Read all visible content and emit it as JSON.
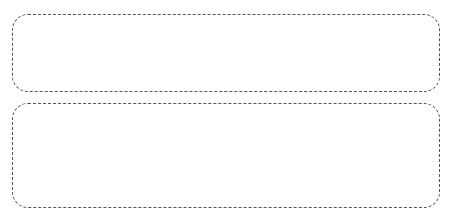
{
  "diagrams": [
    {
      "name": "flat-tree",
      "root": "X",
      "children": [
        "1",
        "2",
        "3",
        "4",
        "5",
        "6",
        "7",
        "8",
        "9",
        "10",
        "11",
        "12",
        "13",
        "14",
        "15",
        "16",
        "17",
        "18"
      ]
    },
    {
      "name": "hierarchical-tree",
      "root": "X",
      "groups": [
        {
          "label": "1",
          "children": [
            "4",
            "5",
            "6",
            "7",
            "8"
          ]
        },
        {
          "label": "2",
          "children": [
            "9",
            "10",
            "11",
            "12",
            "13"
          ]
        },
        {
          "label": "3",
          "children": [
            "14",
            "15",
            "16",
            "17",
            "18"
          ]
        }
      ]
    }
  ],
  "colors": {
    "node_fill": "#2e2e2e",
    "node_text": "#e8e8e8",
    "line": "#555555",
    "border": "#555555"
  }
}
